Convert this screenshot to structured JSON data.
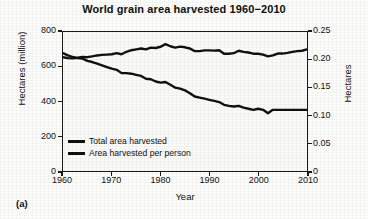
{
  "figure": {
    "panel_label": "(a)"
  },
  "chart_data": {
    "type": "line",
    "title": "World grain area harvested 1960−2010",
    "xlabel": "Year",
    "ylabel": "Hectares (million)",
    "y2label": "Hectares",
    "xlim": [
      1960,
      2010
    ],
    "ylim": [
      0,
      800
    ],
    "y2lim": [
      0,
      0.25
    ],
    "grid": false,
    "legend_position": "bottom-left",
    "xticks": [
      1960,
      1970,
      1980,
      1990,
      2000,
      2010
    ],
    "xtick_labels": [
      "1960",
      "1970",
      "1980",
      "1990",
      "2000",
      "2010"
    ],
    "yticks": [
      0,
      200,
      400,
      600,
      800
    ],
    "ytick_labels": [
      "0",
      "200",
      "400",
      "600",
      "800"
    ],
    "y2ticks": [
      0,
      0.05,
      0.1,
      0.15,
      0.2,
      0.25
    ],
    "y2tick_labels": [
      "0",
      "0.05",
      "0.10",
      "0.15",
      "0.20",
      "0.25"
    ],
    "x": [
      1960,
      1961,
      1962,
      1963,
      1964,
      1965,
      1966,
      1967,
      1968,
      1969,
      1970,
      1971,
      1972,
      1973,
      1974,
      1975,
      1976,
      1977,
      1978,
      1979,
      1980,
      1981,
      1982,
      1983,
      1984,
      1985,
      1986,
      1987,
      1988,
      1989,
      1990,
      1991,
      1992,
      1993,
      1994,
      1995,
      1996,
      1997,
      1998,
      1999,
      2000,
      2001,
      2002,
      2003,
      2004,
      2005,
      2006,
      2007,
      2008,
      2009,
      2010
    ],
    "series": [
      {
        "name": "Total area harvested",
        "axis": "left",
        "unit": "million hectares",
        "values": [
          655,
          650,
          648,
          652,
          657,
          655,
          660,
          665,
          668,
          670,
          672,
          678,
          672,
          686,
          695,
          700,
          705,
          700,
          710,
          708,
          715,
          730,
          718,
          710,
          716,
          712,
          705,
          690,
          690,
          694,
          694,
          693,
          695,
          675,
          675,
          678,
          692,
          686,
          682,
          675,
          675,
          670,
          660,
          665,
          676,
          676,
          680,
          686,
          690,
          692,
          700
        ]
      },
      {
        "name": "Area harvested per person",
        "axis": "right",
        "unit": "hectares per person",
        "values": [
          0.212,
          0.208,
          0.205,
          0.203,
          0.202,
          0.198,
          0.196,
          0.193,
          0.19,
          0.187,
          0.184,
          0.182,
          0.176,
          0.176,
          0.175,
          0.173,
          0.171,
          0.166,
          0.165,
          0.161,
          0.159,
          0.16,
          0.155,
          0.15,
          0.148,
          0.145,
          0.14,
          0.134,
          0.132,
          0.13,
          0.128,
          0.126,
          0.124,
          0.119,
          0.117,
          0.116,
          0.117,
          0.114,
          0.112,
          0.11,
          0.112,
          0.11,
          0.104,
          0.11,
          0.11,
          0.11,
          0.11,
          0.11,
          0.11,
          0.11,
          0.11
        ]
      }
    ]
  }
}
